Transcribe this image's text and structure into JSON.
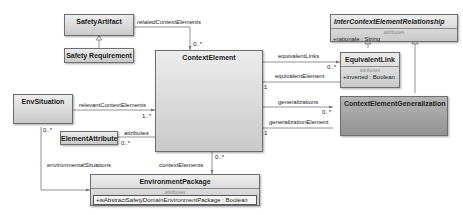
{
  "classes": {
    "safety_artifact": {
      "name": "SafetyArtifact"
    },
    "safety_requirement": {
      "name": "Safety Requirement"
    },
    "context_element": {
      "name": "ContextElement"
    },
    "inter_context_element_relationship": {
      "name": "InterContextElementRelationship",
      "section": "attributes",
      "attributes": [
        "+rationale : String"
      ]
    },
    "equivalent_link": {
      "name": "EquivalentLink",
      "section": "attributes",
      "attributes": [
        "+inverted : Boolean"
      ]
    },
    "context_element_generalization": {
      "name": "ContextElementGeneralization"
    },
    "env_situation": {
      "name": "EnvSituation"
    },
    "element_attribute": {
      "name": "ElementAttribute"
    },
    "environment_package": {
      "name": "EnvironmentPackage",
      "section": "attributes",
      "attributes": [
        "+isAbstractSafetyDomainEnvironmentPackage : Boolean"
      ]
    }
  },
  "associations": {
    "related_context_elements": {
      "role": "relatedContextElements",
      "multiplicity": "0..*"
    },
    "equivalent_links": {
      "role": "equivalentLinks",
      "multiplicity": "0..*"
    },
    "equivalent_element": {
      "role": "equivalentElement",
      "multiplicity": "1"
    },
    "generalizations": {
      "role": "generalizations",
      "multiplicity": "0..*"
    },
    "generalization_element": {
      "role": "generalizationElement",
      "multiplicity": "1"
    },
    "relevant_context_elements": {
      "role": "relevantContextElements",
      "multiplicity": "1..*"
    },
    "attributes": {
      "role": "attributes",
      "multiplicity": "0..*"
    },
    "environmental_situations": {
      "role": "environmentalSituations",
      "multiplicity": "0..*"
    },
    "context_elements": {
      "role": "contextElements",
      "multiplicity": "0..*"
    }
  }
}
